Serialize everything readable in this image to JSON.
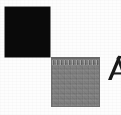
{
  "canvas": {
    "width": 121,
    "height": 115,
    "background_color": "#fdfdfd",
    "description": "Scanned figure fragment: two offset squares with a clipped letter at the right edge"
  },
  "figure": {
    "shapes": [
      {
        "name": "black-square",
        "kind": "square",
        "fill_color": "#0a0a0a",
        "fill_label": "solid black",
        "x": 5,
        "y": 7,
        "width": 45,
        "height": 50
      },
      {
        "name": "gray-square",
        "kind": "square",
        "fill_color": "#808080",
        "fill_label": "halftone gray",
        "border_color": "#6a6a6a",
        "x": 51,
        "y": 57,
        "width": 49,
        "height": 50
      }
    ],
    "arrangement": "diagonal offset, corner-to-corner"
  },
  "margin_glyph": {
    "name": "clipped-letter-a",
    "character": "A",
    "color": "#1a1a1a",
    "x": 106,
    "y": 55,
    "width": 15,
    "height": 26,
    "clipped": "right edge of image"
  }
}
